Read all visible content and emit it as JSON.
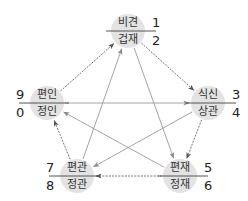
{
  "diagram": {
    "title": "",
    "nodes": [
      {
        "id": "top",
        "upper": "비견",
        "lower": "겁재",
        "num_upper": "1",
        "num_lower": "2",
        "cx": 128,
        "cy": 31,
        "num_side": "right"
      },
      {
        "id": "right",
        "upper": "식신",
        "lower": "상관",
        "num_upper": "3",
        "num_lower": "4",
        "cx": 208,
        "cy": 103,
        "num_side": "right"
      },
      {
        "id": "bottom_right",
        "upper": "편재",
        "lower": "정재",
        "num_upper": "5",
        "num_lower": "6",
        "cx": 180,
        "cy": 176,
        "num_side": "right"
      },
      {
        "id": "bottom_left",
        "upper": "편관",
        "lower": "정관",
        "num_upper": "7",
        "num_lower": "8",
        "cx": 77,
        "cy": 176,
        "num_side": "left"
      },
      {
        "id": "left",
        "upper": "편인",
        "lower": "정인",
        "num_upper": "9",
        "num_lower": "0",
        "cx": 47,
        "cy": 103,
        "num_side": "left"
      }
    ],
    "edges": [
      {
        "from": "left",
        "to": "top",
        "style": "cycle"
      },
      {
        "from": "top",
        "to": "right",
        "style": "cycle"
      },
      {
        "from": "right",
        "to": "bottom_right",
        "style": "cycle"
      },
      {
        "from": "bottom_right",
        "to": "bottom_left",
        "style": "cycle"
      },
      {
        "from": "bottom_left",
        "to": "left",
        "style": "cycle"
      },
      {
        "from": "top",
        "to": "bottom_right",
        "style": "control"
      },
      {
        "from": "bottom_right",
        "to": "left",
        "style": "control"
      },
      {
        "from": "left",
        "to": "right",
        "style": "control"
      },
      {
        "from": "right",
        "to": "bottom_left",
        "style": "control"
      },
      {
        "from": "bottom_left",
        "to": "top",
        "style": "control"
      }
    ],
    "colors": {
      "node_fill": "#e3e3e3",
      "cycle_edge": "#666666",
      "control_edge": "#9a9a9a",
      "text": "#333333"
    }
  }
}
